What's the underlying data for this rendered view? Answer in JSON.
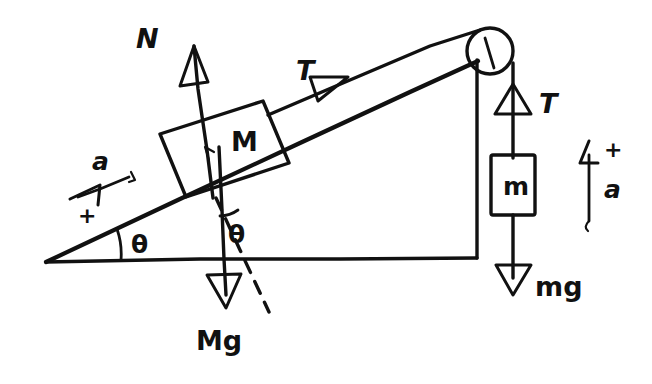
{
  "figure": {
    "kind": "free-body-diagram",
    "ink_color": "#111111",
    "background_color": "#ffffff",
    "width": 652,
    "height": 384
  },
  "labels": {
    "normal_force": "N",
    "tension_incline": "T",
    "tension_hanging": "T",
    "block_incline": "M",
    "block_hanging": "m",
    "weight_incline": "Mg",
    "weight_hanging": "mg",
    "angle_base": "θ",
    "angle_weight": "θ",
    "accel_incline": "a",
    "accel_incline_sign": "+",
    "accel_hanging": "a",
    "accel_hanging_sign": "+"
  },
  "geometry": {
    "incline_apex": [
      45,
      261
    ],
    "incline_top": [
      477,
      60
    ],
    "base_right": [
      477,
      259
    ],
    "angle_deg": 25,
    "pulley_center": [
      489,
      51
    ],
    "pulley_radius": 23
  },
  "icons": {
    "pulley": "pulley-icon",
    "arrow_open_head": "open-arrowhead-icon",
    "dashed_reference_line": "dashed-line-icon"
  }
}
